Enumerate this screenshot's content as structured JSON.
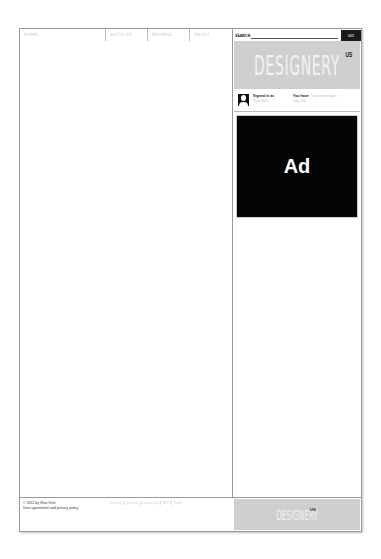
{
  "nav": {
    "items": [
      {
        "label": "HOME"
      },
      {
        "label": "ARTICLES"
      },
      {
        "label": "BROWSE"
      },
      {
        "label": "ABOUT"
      }
    ]
  },
  "search": {
    "label": "SEARCH",
    "value": "",
    "go_label": "GO"
  },
  "logo": {
    "text": "DESIGNERY",
    "sup": "US"
  },
  "user": {
    "signed_in_label": "Signed in as",
    "username": "Khoi Vinh",
    "messages_prefix": "You have",
    "messages_text": "7 new messages",
    "logout_label": "Log Out"
  },
  "ad": {
    "label": "Ad"
  },
  "footer": {
    "copyright": "© 2011 by Khoi Vinh",
    "policy": "User agreement and privacy policy",
    "links": [
      {
        "label": "Site Map"
      },
      {
        "label": "Archives"
      },
      {
        "label": "Contact Us"
      },
      {
        "label": "RSS"
      },
      {
        "label": "Twitter"
      }
    ],
    "logo_text": "DESIGNERY",
    "logo_sup": "US"
  },
  "colors": {
    "logo_bg": "#cfcfcf",
    "ad_bg": "#050505",
    "border": "#9a9a9a"
  }
}
